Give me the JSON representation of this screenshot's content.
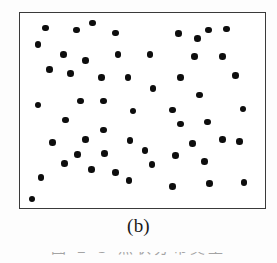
{
  "figure": {
    "panel_label": "(b)",
    "caption_partial": "图 2-3   点状分布类型",
    "background_color": "#fdfdfd",
    "panel_background_color": "#ffffff",
    "border_color": "#3a3a3a",
    "dot_color": "#0d0d0d"
  },
  "chart_data": {
    "type": "scatter",
    "title": "(b)",
    "subtitle": "",
    "xlabel": "",
    "ylabel": "",
    "xlim": [
      0,
      247
    ],
    "ylim": [
      0,
      197
    ],
    "grid": false,
    "legend": null,
    "axis_ticks": false,
    "marker": {
      "shape": "circle",
      "color": "#0d0d0d",
      "size_px": 6.6
    },
    "point_count": 52,
    "points": [
      {
        "x": 26,
        "y": 15
      },
      {
        "x": 57,
        "y": 17
      },
      {
        "x": 73,
        "y": 10
      },
      {
        "x": 96,
        "y": 20
      },
      {
        "x": 160,
        "y": 21
      },
      {
        "x": 190,
        "y": 17
      },
      {
        "x": 208,
        "y": 16
      },
      {
        "x": 18,
        "y": 32
      },
      {
        "x": 179,
        "y": 26
      },
      {
        "x": 44,
        "y": 42
      },
      {
        "x": 66,
        "y": 48
      },
      {
        "x": 99,
        "y": 42
      },
      {
        "x": 131,
        "y": 42
      },
      {
        "x": 176,
        "y": 44
      },
      {
        "x": 204,
        "y": 44
      },
      {
        "x": 30,
        "y": 57
      },
      {
        "x": 51,
        "y": 61
      },
      {
        "x": 82,
        "y": 65
      },
      {
        "x": 109,
        "y": 65
      },
      {
        "x": 162,
        "y": 65
      },
      {
        "x": 217,
        "y": 63
      },
      {
        "x": 134,
        "y": 76
      },
      {
        "x": 61,
        "y": 89
      },
      {
        "x": 84,
        "y": 89
      },
      {
        "x": 181,
        "y": 83
      },
      {
        "x": 18,
        "y": 93
      },
      {
        "x": 114,
        "y": 99
      },
      {
        "x": 154,
        "y": 98
      },
      {
        "x": 225,
        "y": 97
      },
      {
        "x": 46,
        "y": 108
      },
      {
        "x": 189,
        "y": 110
      },
      {
        "x": 84,
        "y": 118
      },
      {
        "x": 66,
        "y": 128
      },
      {
        "x": 33,
        "y": 131
      },
      {
        "x": 162,
        "y": 112
      },
      {
        "x": 111,
        "y": 129
      },
      {
        "x": 204,
        "y": 128
      },
      {
        "x": 58,
        "y": 143
      },
      {
        "x": 85,
        "y": 142
      },
      {
        "x": 126,
        "y": 139
      },
      {
        "x": 174,
        "y": 132
      },
      {
        "x": 221,
        "y": 130
      },
      {
        "x": 157,
        "y": 144
      },
      {
        "x": 45,
        "y": 152
      },
      {
        "x": 72,
        "y": 158
      },
      {
        "x": 96,
        "y": 161
      },
      {
        "x": 133,
        "y": 153
      },
      {
        "x": 186,
        "y": 150
      },
      {
        "x": 21,
        "y": 166
      },
      {
        "x": 110,
        "y": 169
      },
      {
        "x": 154,
        "y": 175
      },
      {
        "x": 191,
        "y": 172
      },
      {
        "x": 226,
        "y": 171
      },
      {
        "x": 12,
        "y": 188
      }
    ]
  }
}
